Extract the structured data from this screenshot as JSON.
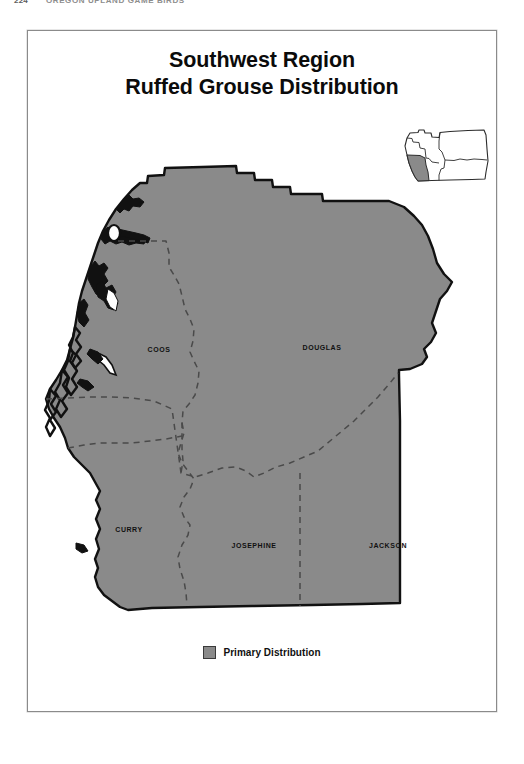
{
  "page": {
    "folio": "224",
    "running_head": "OREGON UPLAND GAME BIRDS"
  },
  "figure": {
    "title_line1": "Southwest Region",
    "title_line2": "Ruffed Grouse Distribution"
  },
  "inset": {
    "name": "oregon-state-locator-inset",
    "highlighted_region": "Southwest",
    "highlight_color": "#8a8a8a",
    "outline_color": "#2b2b2b",
    "background_color": "#ffffff"
  },
  "map": {
    "fill_color": "#8a8a8a",
    "outline_color": "#111111",
    "county_boundary_color": "#4a4a4a",
    "county_labels": [
      {
        "name": "COOS",
        "x": 127,
        "y": 320
      },
      {
        "name": "DOUGLAS",
        "x": 290,
        "y": 318
      },
      {
        "name": "CURRY",
        "x": 97,
        "y": 500
      },
      {
        "name": "JOSEPHINE",
        "x": 220,
        "y": 516
      },
      {
        "name": "JACKSON",
        "x": 354,
        "y": 516
      }
    ]
  },
  "legend": {
    "swatch_color": "#8a8a8a",
    "label": "Primary Distribution"
  }
}
